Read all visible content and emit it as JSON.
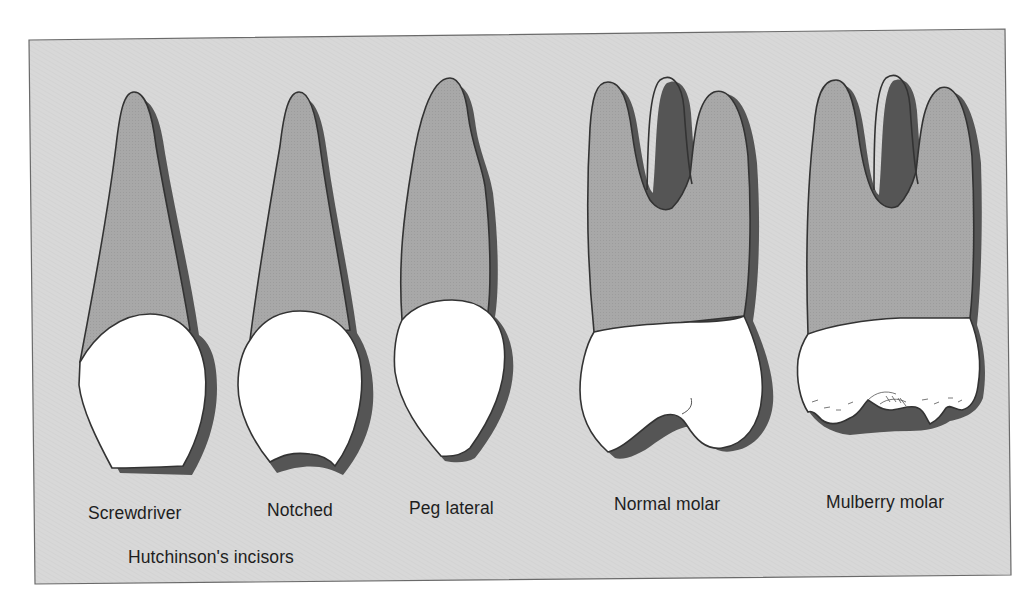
{
  "figure": {
    "background_color": "#d9d9d9",
    "root_color": "#a9a9a9",
    "crown_color": "#ffffff",
    "outline_color": "#3a3a3a",
    "teeth": [
      {
        "id": "screwdriver",
        "label": "Screwdriver",
        "type": "incisor"
      },
      {
        "id": "notched",
        "label": "Notched",
        "type": "incisor"
      },
      {
        "id": "peg-lateral",
        "label": "Peg lateral",
        "type": "incisor"
      },
      {
        "id": "normal-molar",
        "label": "Normal molar",
        "type": "molar"
      },
      {
        "id": "mulberry-molar",
        "label": "Mulberry molar",
        "type": "molar"
      }
    ],
    "group_label": "Hutchinson's incisors"
  }
}
